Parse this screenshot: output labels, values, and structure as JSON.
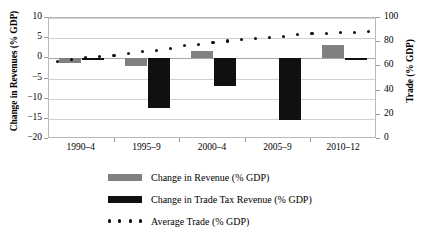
{
  "chart_data": {
    "type": "bar",
    "title": "",
    "subtitle": "",
    "xlabel": "",
    "ylabel": "Change in Revenues (% GDP)",
    "y2label": "Trade (% GDP)",
    "categories": [
      "1990–4",
      "1995–9",
      "2000–4",
      "2005–9",
      "2010–12"
    ],
    "ylim": [
      -20,
      10
    ],
    "yticks": [
      10,
      5,
      0,
      -5,
      -10,
      -15,
      -20
    ],
    "ytick_labels": [
      "10",
      "5",
      "0",
      "−5",
      "−10",
      "−15",
      "−20"
    ],
    "y2lim": [
      0,
      100
    ],
    "y2ticks": [
      100,
      80,
      60,
      40,
      20,
      0
    ],
    "y2tick_labels": [
      "100",
      "80",
      "60",
      "40",
      "20",
      "0"
    ],
    "grid": true,
    "legend_position": "bottom",
    "series": [
      {
        "name": "Change in Revenue (% GDP)",
        "type": "bar",
        "axis": "left",
        "color": "#808080",
        "values": [
          -1.2,
          -2.0,
          1.8,
          0.0,
          3.3
        ]
      },
      {
        "name": "Change in Trade Tax Revenue (% GDP)",
        "type": "bar",
        "axis": "left",
        "color": "#101010",
        "values": [
          -0.3,
          -12.3,
          -6.8,
          -15.3,
          -0.5
        ]
      },
      {
        "name": "Average Trade (% GDP)",
        "type": "line-dotted",
        "axis": "right",
        "color": "#0d0d0d",
        "x": [
          1,
          2,
          3,
          4,
          5,
          6,
          7,
          8,
          9,
          10,
          11,
          12,
          13,
          14,
          15,
          16,
          17,
          18,
          19,
          20,
          21,
          22,
          23
        ],
        "values": [
          64,
          66,
          67,
          68,
          69,
          71,
          72,
          73,
          75,
          77,
          78,
          80,
          81,
          82,
          83,
          84,
          85,
          86,
          87,
          87,
          88,
          88,
          89
        ]
      }
    ]
  },
  "legend": {
    "items": [
      {
        "label": "Change in Revenue (% GDP)",
        "marker": "swatch-gray"
      },
      {
        "label": "Change in Trade Tax Revenue (% GDP)",
        "marker": "swatch-black"
      },
      {
        "label": "Average Trade (% GDP)",
        "marker": "dotted-line"
      }
    ]
  }
}
